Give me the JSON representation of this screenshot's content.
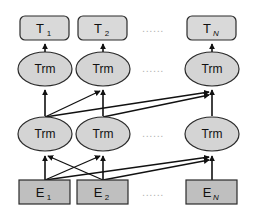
{
  "diagram": {
    "type": "neural-network-architecture",
    "colors": {
      "background": "#ffffff",
      "output_box_fill": "#d9d9d9",
      "input_box_fill": "#bfbfbf",
      "transformer_fill": "#d4d4d4",
      "stroke": "#2b2b2b",
      "arrow": "#111111",
      "ellipsis": "#b4b4b4"
    },
    "ellipsis_text": "......",
    "rows": {
      "output": {
        "name": "output-token-representations",
        "shape": "rounded-rectangle",
        "nodes": [
          {
            "main": "T",
            "sub": "1",
            "sub_italic": false
          },
          {
            "main": "T",
            "sub": "2",
            "sub_italic": false
          },
          {
            "main": "T",
            "sub": "N",
            "sub_italic": true
          }
        ]
      },
      "transformer_upper": {
        "name": "transformer-layer-2",
        "shape": "ellipse",
        "nodes": [
          {
            "main": "Trm"
          },
          {
            "main": "Trm"
          },
          {
            "main": "Trm"
          }
        ]
      },
      "transformer_lower": {
        "name": "transformer-layer-1",
        "shape": "ellipse",
        "nodes": [
          {
            "main": "Trm"
          },
          {
            "main": "Trm"
          },
          {
            "main": "Trm"
          }
        ]
      },
      "input": {
        "name": "input-embeddings",
        "shape": "rectangle",
        "nodes": [
          {
            "main": "E",
            "sub": "1",
            "sub_italic": false
          },
          {
            "main": "E",
            "sub": "2",
            "sub_italic": false
          },
          {
            "main": "E",
            "sub": "N",
            "sub_italic": true
          }
        ]
      }
    }
  }
}
